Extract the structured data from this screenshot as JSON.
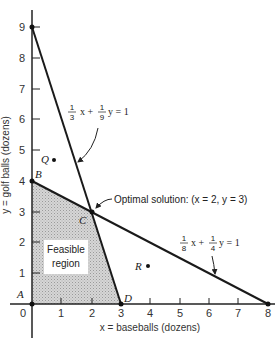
{
  "diagram": {
    "type": "linear-programming-graph",
    "x_axis": {
      "label": "x = baseballs (dozens)",
      "ticks": [
        "0",
        "1",
        "2",
        "3",
        "4",
        "5",
        "6",
        "7",
        "8"
      ]
    },
    "y_axis": {
      "label": "y = golf balls (dozens)",
      "ticks": [
        "1",
        "2",
        "3",
        "4",
        "5",
        "6",
        "7",
        "8",
        "9"
      ]
    },
    "constraints": [
      {
        "name": "constraint-1",
        "equation_text": "1/3 x + 1/9 y = 1",
        "frac1": {
          "num": "1",
          "den": "3"
        },
        "var1": "x +",
        "frac2": {
          "num": "1",
          "den": "9"
        },
        "var2": "y = 1",
        "endpoints": [
          [
            0,
            9
          ],
          [
            3,
            0
          ]
        ]
      },
      {
        "name": "constraint-2",
        "equation_text": "1/8 x + 1/4 y = 1",
        "frac1": {
          "num": "1",
          "den": "8"
        },
        "var1": "x +",
        "frac2": {
          "num": "1",
          "den": "4"
        },
        "var2": "y = 1",
        "endpoints": [
          [
            0,
            4
          ],
          [
            8,
            0
          ]
        ]
      }
    ],
    "points": {
      "A": {
        "label": "A",
        "x": 0,
        "y": 0
      },
      "B": {
        "label": "B",
        "x": 0,
        "y": 4
      },
      "C": {
        "label": "C",
        "x": 2,
        "y": 3
      },
      "D": {
        "label": "D",
        "x": 3,
        "y": 0
      },
      "Q": {
        "label": "Q"
      },
      "R": {
        "label": "R"
      }
    },
    "feasible_region": {
      "label_line1": "Feasible",
      "label_line2": "region",
      "vertices": [
        [
          0,
          0
        ],
        [
          0,
          4
        ],
        [
          2,
          3
        ],
        [
          3,
          0
        ]
      ]
    },
    "optimal_annotation": "Optimal solution: (x = 2, y = 3)"
  }
}
